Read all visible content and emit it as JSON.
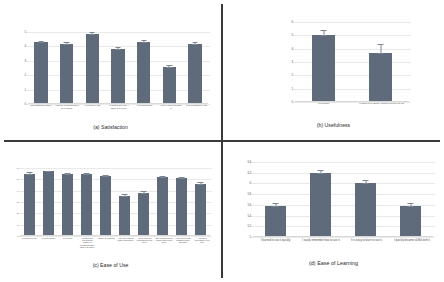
{
  "figure": {
    "background": "#ffffff",
    "bar_color": "#5f6b7a",
    "error_bar_color": "#7d8794",
    "grid_color": "#e9e9e9"
  },
  "panels": {
    "a": {
      "caption": "(a) Satisfaction",
      "yticks": [
        "0",
        "1",
        "2",
        "3",
        "4",
        "5"
      ],
      "categories": [
        "I am satisfied with it.",
        "I would recommend it to a friend.",
        "It is fun to use.",
        "It works the way I want it to work.",
        "It is wonderful.",
        "I feel I need to have it.",
        "It is pleasant to use."
      ],
      "values": [
        4.3,
        4.2,
        4.85,
        3.85,
        4.3,
        2.6,
        4.15
      ],
      "errors": [
        0.18,
        0.2,
        0.2,
        0.2,
        0.2,
        0.2,
        0.2
      ]
    },
    "b": {
      "caption": "(b) Usefulness",
      "yticks": [
        "0",
        "1",
        "2",
        "3",
        "4",
        "5",
        "6"
      ],
      "categories": [
        "It is useful.",
        "It does everything I would expect it to do."
      ],
      "values": [
        5.0,
        3.7
      ],
      "errors": [
        0.5,
        0.75
      ]
    },
    "c": {
      "caption": "(c) Ease of Use",
      "yticks": [
        "0",
        "1",
        "2",
        "3",
        "4",
        "5",
        "6"
      ],
      "categories": [
        "It is simple to use.",
        "It is user friendly.",
        "It is flexible.",
        "It requires the fewest steps possible to accomplish what I want to do with it.",
        "Using it is effortless.",
        "I can use it without written instructions.",
        "I don't notice any inconsistencies as I use it.",
        "Both occasional and regular users would like it.",
        "I can recover from mistakes quickly and easily.",
        "I can use it successfully every time."
      ],
      "values": [
        5.5,
        5.7,
        5.45,
        5.45,
        5.3,
        3.5,
        3.8,
        5.2,
        5.1,
        4.6
      ],
      "errors": [
        0.2,
        0.15,
        0.18,
        0.18,
        0.2,
        0.3,
        0.3,
        0.2,
        0.2,
        0.25
      ]
    },
    "d": {
      "caption": "(d) Ease of Learning",
      "yticks": [
        "6.4",
        "6.2",
        "6",
        "5.8",
        "5.6",
        "5.4",
        "5.2",
        "5"
      ],
      "ymin": 5,
      "ymax": 6.4,
      "categories": [
        "I learned to use it quickly.",
        "I easily remember how to use it.",
        "It is easy to learn to use it.",
        "I quickly became skillful with it."
      ],
      "values": [
        5.58,
        6.2,
        6.0,
        5.57
      ],
      "errors": [
        0.08,
        0.07,
        0.09,
        0.09
      ]
    }
  },
  "chart_data": [
    {
      "type": "bar",
      "title": "(a) Satisfaction",
      "categories": [
        "I am satisfied with it.",
        "I would recommend it to a friend.",
        "It is fun to use.",
        "It works the way I want it to work.",
        "It is wonderful.",
        "I feel I need to have it.",
        "It is pleasant to use."
      ],
      "values": [
        4.3,
        4.2,
        4.85,
        3.85,
        4.3,
        2.6,
        4.15
      ],
      "errors": [
        0.18,
        0.2,
        0.2,
        0.2,
        0.2,
        0.2,
        0.2
      ],
      "xlabel": "",
      "ylabel": "",
      "ylim": [
        0,
        5
      ],
      "grid": true,
      "legend": "none"
    },
    {
      "type": "bar",
      "title": "(b) Usefulness",
      "categories": [
        "It is useful.",
        "It does everything I would expect it to do."
      ],
      "values": [
        5.0,
        3.7
      ],
      "errors": [
        0.5,
        0.75
      ],
      "xlabel": "",
      "ylabel": "",
      "ylim": [
        0,
        6
      ],
      "grid": true,
      "legend": "none"
    },
    {
      "type": "bar",
      "title": "(c) Ease of Use",
      "categories": [
        "It is simple to use.",
        "It is user friendly.",
        "It is flexible.",
        "It requires the fewest steps possible to accomplish what I want to do with it.",
        "Using it is effortless.",
        "I can use it without written instructions.",
        "I don't notice any inconsistencies as I use it.",
        "Both occasional and regular users would like it.",
        "I can recover from mistakes quickly and easily.",
        "I can use it successfully every time."
      ],
      "values": [
        5.5,
        5.7,
        5.45,
        5.45,
        5.3,
        3.5,
        3.8,
        5.2,
        5.1,
        4.6
      ],
      "errors": [
        0.2,
        0.15,
        0.18,
        0.18,
        0.2,
        0.3,
        0.3,
        0.2,
        0.2,
        0.25
      ],
      "xlabel": "",
      "ylabel": "",
      "ylim": [
        0,
        6
      ],
      "grid": true,
      "legend": "none"
    },
    {
      "type": "bar",
      "title": "(d) Ease of Learning",
      "categories": [
        "I learned to use it quickly.",
        "I easily remember how to use it.",
        "It is easy to learn to use it.",
        "I quickly became skillful with it."
      ],
      "values": [
        5.58,
        6.2,
        6.0,
        5.57
      ],
      "errors": [
        0.08,
        0.07,
        0.09,
        0.09
      ],
      "xlabel": "",
      "ylabel": "",
      "ylim": [
        5,
        6.4
      ],
      "grid": true,
      "legend": "none"
    }
  ]
}
